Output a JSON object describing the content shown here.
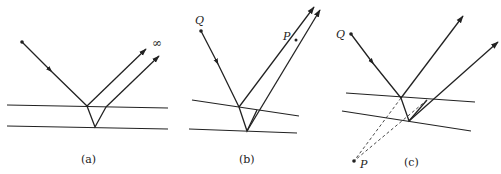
{
  "figure": {
    "colors": {
      "stroke": "#222222",
      "background": "#ffffff"
    },
    "panels": [
      {
        "id": "a",
        "caption": "(a)",
        "source_label": "",
        "image_label": "∞",
        "film": "parallel surfaces",
        "note": "Reflected rays are parallel, meeting at infinity"
      },
      {
        "id": "b",
        "caption": "(b)",
        "source_label": "Q",
        "image_label": "P",
        "film": "wedge-shaped surfaces",
        "note": "Reflected rays converge to a real point P above the film"
      },
      {
        "id": "c",
        "caption": "(c)",
        "source_label": "Q",
        "image_label": "P",
        "film": "wedge-shaped surfaces",
        "note": "Reflected rays diverge; extensions (dashed) meet at virtual point P below the film"
      }
    ]
  }
}
